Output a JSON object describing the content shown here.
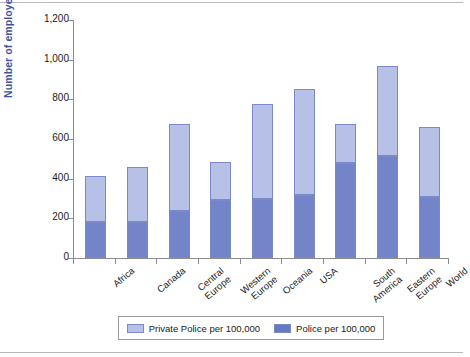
{
  "chart_data": {
    "type": "bar",
    "subtype": "stacked-bar",
    "title": "",
    "xlabel": "",
    "ylabel": "Number of employees",
    "ylim": [
      0,
      1200
    ],
    "ytick_values": [
      0,
      200,
      400,
      600,
      800,
      1000,
      1200
    ],
    "ytick_labels": [
      "0",
      "200",
      "400",
      "600",
      "800",
      "1,000",
      "1,200"
    ],
    "grid": false,
    "legend_position": "bottom",
    "categories": [
      "Africa",
      "Canada",
      "Central Europe",
      "Western Europe",
      "Oceania",
      "USA",
      "South America",
      "Eastern Europe",
      "World"
    ],
    "category_lines": [
      [
        "Africa"
      ],
      [
        "Canada"
      ],
      [
        "Central",
        "Europe"
      ],
      [
        "Western",
        "Europe"
      ],
      [
        "Oceania"
      ],
      [
        "USA"
      ],
      [
        "South",
        "America"
      ],
      [
        "Eastern",
        "Europe"
      ],
      [
        "World"
      ]
    ],
    "series": [
      {
        "name": "Police per 100,000",
        "color": "#7384c8",
        "values": [
          183,
          183,
          235,
          291,
          296,
          320,
          478,
          513,
          310
        ]
      },
      {
        "name": "Private Police per 100,000",
        "color": "#b7c0e6",
        "values": [
          229,
          275,
          440,
          194,
          479,
          530,
          197,
          455,
          350
        ]
      }
    ],
    "totals": [
      412,
      458,
      675,
      485,
      775,
      850,
      675,
      968,
      660
    ]
  },
  "legend": {
    "entries": [
      {
        "label": "Private Police per 100,000",
        "swatch": "light"
      },
      {
        "label": "Police per 100,000",
        "swatch": "dark"
      }
    ]
  },
  "colors": {
    "police": "#7384c8",
    "private_police": "#b7c0e6",
    "axis": "#8d8d8d",
    "ylabel_text": "#3b55a4",
    "background": "#ffffff"
  }
}
